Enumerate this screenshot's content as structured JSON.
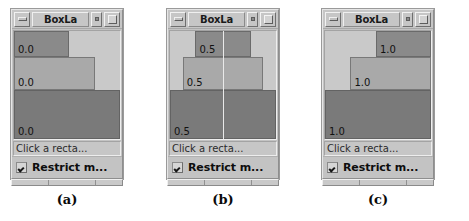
{
  "figure": {
    "background": "#ffffff",
    "panels": [
      {
        "caption": "(a)",
        "window": {
          "title": "BoxLa",
          "minimize_icon": "minimize-icon",
          "small_icon": "small-box-icon",
          "maximize_icon": "maximize-icon"
        },
        "alignment": "0.0",
        "show_center_line": false,
        "rectangles": [
          {
            "label": "0.0",
            "width_pct": 52,
            "height_pct": 24,
            "color": "#8a8a8a",
            "align": "flex-start"
          },
          {
            "label": "0.0",
            "width_pct": 76,
            "height_pct": 31,
            "color": "#a9a9a9",
            "align": "flex-start"
          },
          {
            "label": "0.0",
            "width_pct": 100,
            "height_pct": 45,
            "color": "#7a7a7a",
            "align": "flex-start"
          }
        ],
        "status_text": "Click a recta...",
        "checkbox": {
          "checked": true,
          "label": "Restrict m..."
        },
        "trough_segments": [
          34,
          42,
          24
        ]
      },
      {
        "caption": "(b)",
        "window": {
          "title": "BoxLa",
          "minimize_icon": "minimize-icon",
          "small_icon": "small-box-icon",
          "maximize_icon": "maximize-icon"
        },
        "alignment": "0.5",
        "show_center_line": true,
        "rectangles": [
          {
            "label": "0.5",
            "width_pct": 52,
            "height_pct": 24,
            "color": "#8a8a8a",
            "align": "center"
          },
          {
            "label": "0.5",
            "width_pct": 76,
            "height_pct": 31,
            "color": "#a9a9a9",
            "align": "center"
          },
          {
            "label": "0.5",
            "width_pct": 100,
            "height_pct": 45,
            "color": "#7a7a7a",
            "align": "center"
          }
        ],
        "status_text": "Click a recta...",
        "checkbox": {
          "checked": true,
          "label": "Restrict m..."
        },
        "trough_segments": [
          34,
          42,
          24
        ]
      },
      {
        "caption": "(c)",
        "window": {
          "title": "BoxLa",
          "minimize_icon": "minimize-icon",
          "small_icon": "small-box-icon",
          "maximize_icon": "maximize-icon"
        },
        "alignment": "1.0",
        "show_center_line": false,
        "rectangles": [
          {
            "label": "1.0",
            "width_pct": 52,
            "height_pct": 24,
            "color": "#8a8a8a",
            "align": "flex-end"
          },
          {
            "label": "1.0",
            "width_pct": 76,
            "height_pct": 31,
            "color": "#a9a9a9",
            "align": "flex-end"
          },
          {
            "label": "1.0",
            "width_pct": 100,
            "height_pct": 45,
            "color": "#7a7a7a",
            "align": "flex-end"
          }
        ],
        "status_text": "Click a recta...",
        "checkbox": {
          "checked": true,
          "label": "Restrict m..."
        },
        "trough_segments": [
          34,
          42,
          24
        ]
      }
    ]
  }
}
